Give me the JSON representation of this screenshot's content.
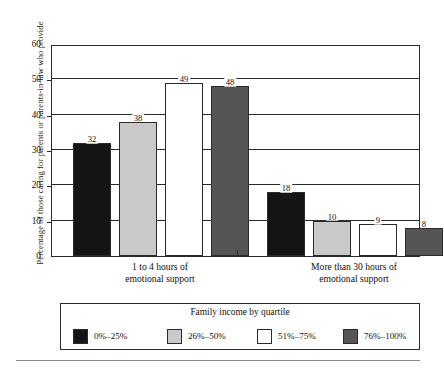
{
  "chart_data": {
    "type": "bar",
    "title": "",
    "xlabel": "",
    "ylabel": "Percentage of those caring for parents or parents-in-law who provide",
    "ylim": [
      0,
      60
    ],
    "yticks": [
      0,
      10,
      20,
      30,
      40,
      50,
      60
    ],
    "grid": true,
    "legend_position": "bottom",
    "legend_title": "Family income by quartile",
    "categories": [
      "1 to 4 hours of emotional support",
      "More than 30 hours of emotional support"
    ],
    "category_lines": [
      [
        "1 to 4 hours of",
        "emotional support"
      ],
      [
        "More than 30 hours of",
        "emotional support"
      ]
    ],
    "series": [
      {
        "name": "0%–25%",
        "color": "#141414",
        "values": [
          32,
          18
        ]
      },
      {
        "name": "26%–50%",
        "color": "#c9c9c9",
        "values": [
          38,
          10
        ]
      },
      {
        "name": "51%–75%",
        "color": "#ffffff",
        "values": [
          49,
          9
        ]
      },
      {
        "name": "76%–100%",
        "color": "#555555",
        "values": [
          48,
          8
        ]
      }
    ]
  },
  "axis": {
    "tick_labels": [
      "0",
      "10",
      "20",
      "30",
      "40",
      "50",
      "60"
    ],
    "y_title": "Percentage of those caring for parents or parents-in-law who provide"
  },
  "legend": {
    "title": "Family income by quartile",
    "entries": [
      {
        "label": "0%–25%",
        "color": "#141414"
      },
      {
        "label": "26%–50%",
        "color": "#c9c9c9"
      },
      {
        "label": "51%–75%",
        "color": "#ffffff"
      },
      {
        "label": "76%–100%",
        "color": "#555555"
      }
    ]
  },
  "value_labels": {
    "group1": [
      "32",
      "38",
      "49",
      "48"
    ],
    "group2": [
      "18",
      "10",
      "9",
      "8"
    ]
  }
}
